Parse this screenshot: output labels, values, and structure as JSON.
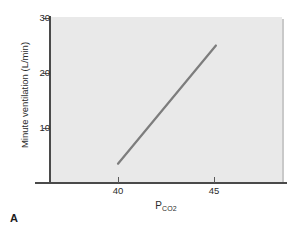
{
  "figure": {
    "panel_letter": "A",
    "background_color": "#ffffff",
    "plot_background_color": "#e9e9e9",
    "line_color": "#7d7d7d",
    "axis_color": "#4a4a4a"
  },
  "chart_data": {
    "type": "line",
    "title": "",
    "subtitle": "",
    "xlabel_main": "P",
    "xlabel_sub": "CO",
    "xlabel_sub2": "2",
    "ylabel": "Minute ventilation (L/min)",
    "xlim": [
      38.0,
      50.0
    ],
    "ylim": [
      0,
      30
    ],
    "xticks": [
      40,
      45
    ],
    "xtick_labels": [
      "40",
      "45"
    ],
    "yticks": [
      10,
      20,
      30
    ],
    "ytick_labels": [
      "10",
      "20",
      "30"
    ],
    "grid": false,
    "legend": null,
    "annotations": [],
    "series": [
      {
        "name": "CO2 ventilatory response",
        "x": [
          40.0,
          45.1
        ],
        "y": [
          3.5,
          25.0
        ]
      }
    ]
  }
}
